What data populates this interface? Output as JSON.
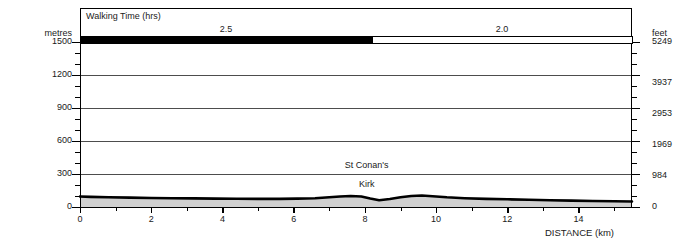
{
  "chart_data": {
    "type": "area",
    "title": "",
    "xlabel": "DISTANCE (km)",
    "ylabel": "metres",
    "ylabel_right": "feet",
    "xlim": [
      0,
      15.5
    ],
    "ylim": [
      0,
      1500
    ],
    "ylim_right": [
      0,
      5249
    ],
    "grid": true,
    "legend": "none",
    "x_ticks": [
      0,
      2,
      4,
      6,
      8,
      10,
      12,
      14
    ],
    "x_tick_labels": [
      "0",
      "2",
      "4",
      "6",
      "8",
      "10",
      "12",
      "14"
    ],
    "x_minor_tick_step": 1,
    "y_ticks_left": [
      0,
      300,
      600,
      900,
      1200,
      1500
    ],
    "y_tick_labels_left": [
      "0",
      "300",
      "600",
      "900",
      "1200",
      "1500"
    ],
    "y_minor_tick_step": 100,
    "y_ticks_right_values": [
      0,
      984,
      1969,
      2953,
      3937,
      5249
    ],
    "y_tick_labels_right": [
      "0",
      "984",
      "1969",
      "2953",
      "3937",
      "5249"
    ],
    "series": [
      {
        "name": "elevation-profile",
        "fill_color": "#d0d0d0",
        "line_color": "#000000",
        "x": [
          0.0,
          0.3,
          0.8,
          1.4,
          2.0,
          2.6,
          3.2,
          3.8,
          4.4,
          5.0,
          5.6,
          6.1,
          6.6,
          7.0,
          7.3,
          7.6,
          7.9,
          8.15,
          8.4,
          8.7,
          9.0,
          9.3,
          9.6,
          9.9,
          10.3,
          10.8,
          11.4,
          12.0,
          12.6,
          13.2,
          13.8,
          14.4,
          15.0,
          15.5
        ],
        "y": [
          95,
          92,
          88,
          85,
          82,
          80,
          78,
          76,
          75,
          74,
          74,
          76,
          80,
          88,
          96,
          100,
          96,
          78,
          62,
          72,
          88,
          100,
          104,
          98,
          88,
          80,
          74,
          70,
          66,
          62,
          58,
          55,
          52,
          50
        ]
      }
    ],
    "annotations": [
      {
        "name": "st-conans-kirk",
        "line1": "St Conan's",
        "line2": "Kirk",
        "x_km": 8.05
      }
    ]
  },
  "walking_time_bar": {
    "title": "Walking Time (hrs)",
    "segments": [
      {
        "label": "2.5",
        "start_km": 0.0,
        "end_km": 8.2,
        "fill": "#000000"
      },
      {
        "label": "2.0",
        "start_km": 8.2,
        "end_km": 15.5,
        "fill": "#ffffff"
      }
    ]
  },
  "colors": {
    "axis": "#000000",
    "gridline": "#4d4d4d",
    "profile_fill": "#d0d0d0",
    "profile_line": "#000000",
    "text": "#1a1a1a"
  }
}
